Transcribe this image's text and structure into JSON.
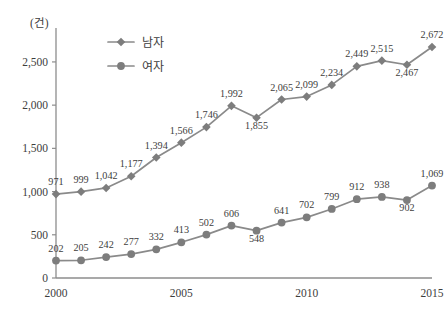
{
  "chart_data": {
    "type": "line",
    "title": "",
    "unit_label": "(건)",
    "xlabel": "",
    "ylabel": "",
    "x": [
      2000,
      2001,
      2002,
      2003,
      2004,
      2005,
      2006,
      2007,
      2008,
      2009,
      2010,
      2011,
      2012,
      2013,
      2014,
      2015
    ],
    "xtick_labels": [
      "2000",
      "2005",
      "2010",
      "2015"
    ],
    "xtick_values": [
      2000,
      2005,
      2010,
      2015
    ],
    "ytick_labels": [
      "0",
      "500",
      "1,000",
      "1,500",
      "2,000",
      "2,500"
    ],
    "ytick_values": [
      0,
      500,
      1000,
      1500,
      2000,
      2500
    ],
    "ylim": [
      0,
      2800
    ],
    "xlim": [
      2000,
      2015
    ],
    "grid": false,
    "legend_position": "top-left",
    "series": [
      {
        "name": "남자",
        "marker": "diamond",
        "color": "#7d7d7d",
        "values": [
          971,
          999,
          1042,
          1177,
          1394,
          1566,
          1746,
          1992,
          1855,
          2065,
          2099,
          2234,
          2449,
          2515,
          2467,
          2672
        ],
        "value_labels": [
          "971",
          "999",
          "1,042",
          "1,177",
          "1,394",
          "1,566",
          "1,746",
          "1,992",
          "1,855",
          "2,065",
          "2,099",
          "2,234",
          "2,449",
          "2,515",
          "2,467",
          "2,672"
        ]
      },
      {
        "name": "여자",
        "marker": "circle",
        "color": "#7d7d7d",
        "values": [
          202,
          205,
          242,
          277,
          332,
          413,
          502,
          606,
          548,
          641,
          702,
          799,
          912,
          938,
          902,
          1069
        ],
        "value_labels": [
          "202",
          "205",
          "242",
          "277",
          "332",
          "413",
          "502",
          "606",
          "548",
          "641",
          "702",
          "799",
          "912",
          "938",
          "902",
          "1,069"
        ]
      }
    ]
  },
  "legend": {
    "entries": [
      {
        "label": "남자",
        "marker": "diamond"
      },
      {
        "label": "여자",
        "marker": "circle"
      }
    ]
  }
}
